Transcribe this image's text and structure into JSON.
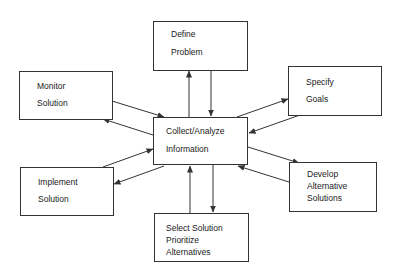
{
  "diagram": {
    "type": "hub-and-spoke flowchart",
    "center": {
      "id": "collect",
      "lines": [
        "Collect/Analyze",
        "Information"
      ]
    },
    "nodes": [
      {
        "id": "define",
        "lines": [
          "Define",
          "Problem"
        ]
      },
      {
        "id": "specify",
        "lines": [
          "Specify",
          "Goals"
        ]
      },
      {
        "id": "develop",
        "lines": [
          "Develop",
          "Alternative",
          "Solutions"
        ]
      },
      {
        "id": "select",
        "lines": [
          "Select Solution",
          "Prioritize",
          "Alternatives"
        ]
      },
      {
        "id": "implement",
        "lines": [
          "Implement",
          "Solution"
        ]
      },
      {
        "id": "monitor",
        "lines": [
          "Monitor",
          "Solution"
        ]
      }
    ],
    "edges": [
      {
        "from": "collect",
        "to": "define"
      },
      {
        "from": "define",
        "to": "collect"
      },
      {
        "from": "collect",
        "to": "specify"
      },
      {
        "from": "specify",
        "to": "collect"
      },
      {
        "from": "collect",
        "to": "develop"
      },
      {
        "from": "develop",
        "to": "collect"
      },
      {
        "from": "collect",
        "to": "select"
      },
      {
        "from": "select",
        "to": "collect"
      },
      {
        "from": "collect",
        "to": "implement"
      },
      {
        "from": "implement",
        "to": "collect"
      },
      {
        "from": "collect",
        "to": "monitor"
      },
      {
        "from": "monitor",
        "to": "collect"
      }
    ],
    "colors": {
      "line": "#333333",
      "background": "#ffffff",
      "text": "#1a1a1a"
    }
  }
}
